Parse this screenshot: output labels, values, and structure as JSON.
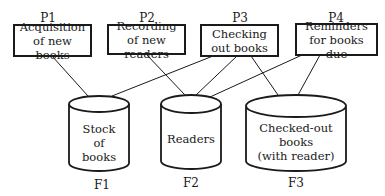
{
  "processes": [
    {
      "id": "P1",
      "line1": "Acquisition",
      "line2": "of new books"
    },
    {
      "id": "P2",
      "line1": "Recording",
      "line2": "of new readers"
    },
    {
      "id": "P3",
      "line1": "Checking",
      "line2": "out books"
    },
    {
      "id": "P4",
      "line1": "Reminders",
      "line2": "for books due"
    }
  ],
  "files": [
    {
      "id": "F1",
      "lines": [
        "Stock",
        "of",
        "books"
      ]
    },
    {
      "id": "F2",
      "lines": [
        "Readers"
      ]
    },
    {
      "id": "F3",
      "lines": [
        "Checked-out",
        "books",
        "(with reader)"
      ]
    }
  ],
  "connections": [
    {
      "from": "P1",
      "to": "F1"
    },
    {
      "from": "P2",
      "to": "F2"
    },
    {
      "from": "P3",
      "to": "F1"
    },
    {
      "from": "P3",
      "to": "F2"
    },
    {
      "from": "P3",
      "to": "F3"
    },
    {
      "from": "P4",
      "to": "F2"
    },
    {
      "from": "P4",
      "to": "F3"
    }
  ],
  "colors": {
    "stroke": "#1a1a1a",
    "background": "#ffffff"
  }
}
